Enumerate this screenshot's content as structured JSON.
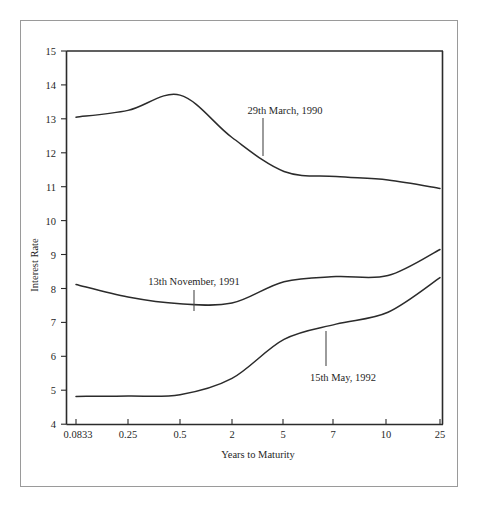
{
  "figure": {
    "name": "yield-curve-figure",
    "background_color": "#ffffff",
    "border_color": "#9a9a9a",
    "ink_color": "#2b2b2b"
  },
  "chart_data": {
    "type": "line",
    "title": "",
    "subtitle": "",
    "xlabel": "Years to Maturity",
    "ylabel": "Interest Rate",
    "x_tick_labels": [
      "0.0833",
      "0.25",
      "0.5",
      "2",
      "5",
      "7",
      "10",
      "25"
    ],
    "x_scale": "ordinal-evenly-spaced",
    "y_tick_labels": [
      "4",
      "5",
      "6",
      "7",
      "8",
      "9",
      "10",
      "11",
      "12",
      "13",
      "14",
      "15"
    ],
    "ylim": [
      4,
      15
    ],
    "y_tick_step": 1,
    "grid": false,
    "legend_position": "inline-annotations",
    "series": [
      {
        "name": "29th March, 1990",
        "x": [
          "0.0833",
          "0.25",
          "0.5",
          "2",
          "5",
          "7",
          "10",
          "25"
        ],
        "values": [
          13.05,
          13.25,
          13.7,
          12.45,
          11.45,
          11.3,
          11.2,
          10.95
        ]
      },
      {
        "name": "13th November, 1991",
        "x": [
          "0.0833",
          "0.25",
          "0.5",
          "2",
          "5",
          "7",
          "10",
          "25"
        ],
        "values": [
          8.12,
          7.75,
          7.55,
          7.57,
          8.2,
          8.35,
          8.38,
          9.15
        ]
      },
      {
        "name": "15th May, 1992",
        "x": [
          "0.0833",
          "0.25",
          "0.5",
          "2",
          "5",
          "7",
          "10",
          "25"
        ],
        "values": [
          4.82,
          4.83,
          4.87,
          5.35,
          6.5,
          6.95,
          7.3,
          8.32
        ]
      }
    ],
    "annotations": [
      {
        "label": "29th March, 1990",
        "series": "29th March, 1990",
        "leader": true,
        "label_x_px": 242,
        "label_y_px": 113,
        "leader_x_px": 263,
        "leader_top_px": 118,
        "leader_bottom_px": 156
      },
      {
        "label": "13th November, 1991",
        "series": "13th November, 1991",
        "leader": true,
        "label_x_px": 148,
        "label_y_px": 285,
        "leader_x_px": 194,
        "leader_top_px": 290,
        "leader_bottom_px": 311
      },
      {
        "label": "15th May, 1992",
        "series": "15th May, 1992",
        "leader": true,
        "label_x_px": 300,
        "label_y_px": 378,
        "leader_x_px": 326,
        "leader_top_px": 331,
        "leader_bottom_px": 366
      }
    ]
  }
}
